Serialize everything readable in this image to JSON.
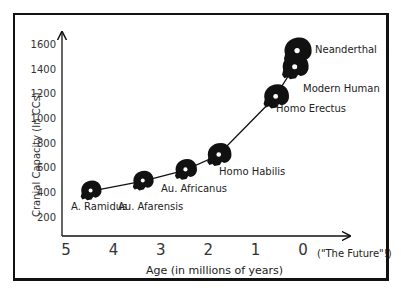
{
  "chart_data": {
    "type": "scatter",
    "title": "",
    "xlabel": "Age (in millions of years)",
    "ylabel": "Cranial Capacity (In CCs)",
    "x_ticks": [
      "5",
      "4",
      "3",
      "2",
      "1",
      "0"
    ],
    "x_tick_annotation": "(\"The Future\"!)",
    "y_ticks": [
      "200",
      "400",
      "600",
      "800",
      "1000",
      "1200",
      "1400",
      "1600"
    ],
    "xlim": [
      5,
      0
    ],
    "ylim": [
      0,
      1700
    ],
    "connected_line": true,
    "grid": false,
    "points": [
      {
        "label": "A. Ramidus",
        "age_mya": 4.5,
        "cc": 410
      },
      {
        "label": "Au. Afarensis",
        "age_mya": 3.4,
        "cc": 490
      },
      {
        "label": "Au. Africanus",
        "age_mya": 2.5,
        "cc": 580
      },
      {
        "label": "Homo Habilis",
        "age_mya": 1.8,
        "cc": 700
      },
      {
        "label": "Homo Erectus",
        "age_mya": 0.6,
        "cc": 1170
      },
      {
        "label": "Modern Human",
        "age_mya": 0.2,
        "cc": 1410
      },
      {
        "label": "Neanderthal",
        "age_mya": 0.15,
        "cc": 1540
      }
    ],
    "marker": "skull-silhouette"
  },
  "colors": {
    "axis": "#111111",
    "marker": "#111111",
    "background": "#ffffff"
  }
}
